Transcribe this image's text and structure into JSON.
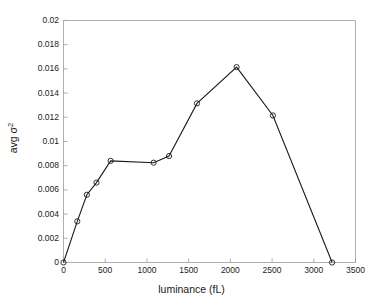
{
  "chart_data": {
    "type": "line",
    "title": "",
    "xlabel": "luminance (fL)",
    "ylabel_text": "avg σ",
    "ylabel_sup": "2",
    "ylabel_full": "avg σ²",
    "xlim": [
      0,
      3500
    ],
    "ylim": [
      0,
      0.02
    ],
    "grid": false,
    "legend": "none",
    "xticks": [
      0,
      500,
      1000,
      1500,
      2000,
      2500,
      3000,
      3500
    ],
    "xtick_labels": [
      "0",
      "500",
      "1000",
      "1500",
      "2000",
      "2500",
      "3000",
      "3500"
    ],
    "yticks": [
      0,
      0.002,
      0.004,
      0.006,
      0.008,
      0.01,
      0.012,
      0.014,
      0.016,
      0.018,
      0.02
    ],
    "ytick_labels": [
      "0",
      "0.002",
      "0.004",
      "0.006",
      "0.008",
      "0.01",
      "0.012",
      "0.014",
      "0.016",
      "0.018",
      "0.02"
    ],
    "marker": "circle-open",
    "line_color": "#1a1a1a",
    "marker_color": "#1a1a1a",
    "axis_color": "#9a9a9a",
    "background_color": "#ffffff",
    "x": [
      0,
      165,
      280,
      395,
      565,
      1080,
      1265,
      1600,
      2075,
      2510,
      3220
    ],
    "y": [
      0.0,
      0.0034,
      0.0056,
      0.0066,
      0.0084,
      0.00825,
      0.0088,
      0.01315,
      0.01615,
      0.01215,
      0.0
    ],
    "points": [
      {
        "x": 0,
        "y": 0.0
      },
      {
        "x": 165,
        "y": 0.0034
      },
      {
        "x": 280,
        "y": 0.0056
      },
      {
        "x": 395,
        "y": 0.0066
      },
      {
        "x": 565,
        "y": 0.0084
      },
      {
        "x": 1080,
        "y": 0.00825
      },
      {
        "x": 1265,
        "y": 0.0088
      },
      {
        "x": 1600,
        "y": 0.01315
      },
      {
        "x": 2075,
        "y": 0.01615
      },
      {
        "x": 2510,
        "y": 0.01215
      },
      {
        "x": 3220,
        "y": 0.0
      }
    ]
  }
}
